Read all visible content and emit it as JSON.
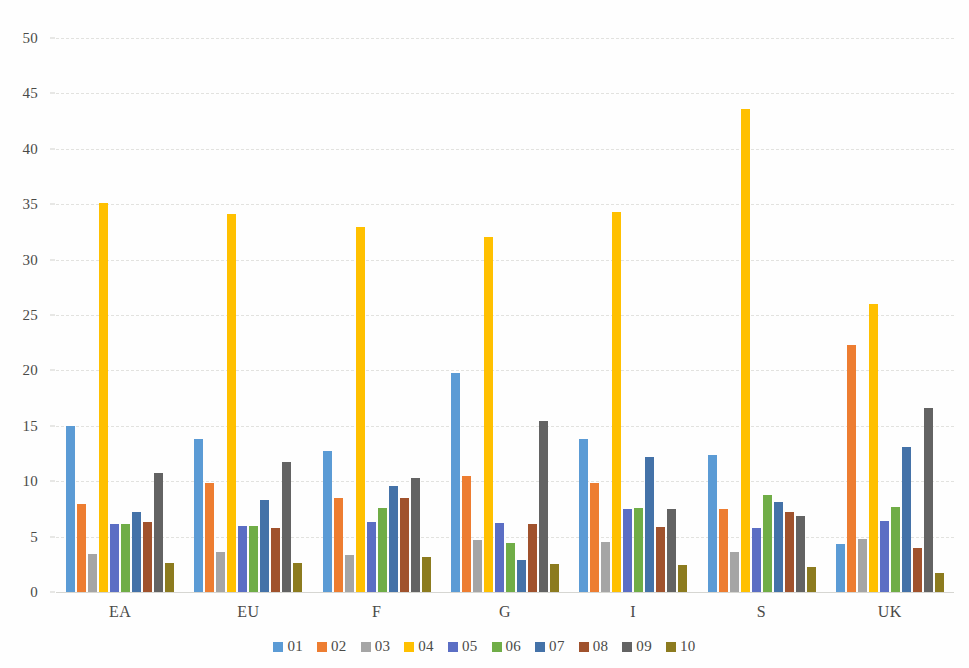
{
  "chart_data": {
    "type": "bar",
    "title": "",
    "subtitle": "",
    "xlabel": "",
    "ylabel": "",
    "ylim": [
      0,
      50
    ],
    "ytick_step": 5,
    "yticks": [
      "50",
      "45",
      "40",
      "35",
      "30",
      "25",
      "20",
      "15",
      "10",
      "5",
      "0"
    ],
    "grid": true,
    "grid_axis": "y",
    "legend_position": "bottom",
    "categories": [
      "EA",
      "EU",
      "F",
      "G",
      "I",
      "S",
      "UK"
    ],
    "series": [
      {
        "name": "01",
        "color": "#5b9bd5",
        "values": [
          15.0,
          13.8,
          12.7,
          19.8,
          13.8,
          12.4,
          4.3
        ]
      },
      {
        "name": "02",
        "color": "#ed7d31",
        "values": [
          7.9,
          9.8,
          8.5,
          10.5,
          9.8,
          7.5,
          22.3
        ]
      },
      {
        "name": "03",
        "color": "#a5a5a5",
        "values": [
          3.4,
          3.6,
          3.3,
          4.7,
          4.5,
          3.6,
          4.8
        ]
      },
      {
        "name": "04",
        "color": "#ffc000",
        "values": [
          35.1,
          34.1,
          32.9,
          32.0,
          34.3,
          43.6,
          26.0
        ]
      },
      {
        "name": "05",
        "color": "#5b6ec4",
        "values": [
          6.1,
          6.0,
          6.3,
          6.2,
          7.5,
          5.8,
          6.4
        ]
      },
      {
        "name": "06",
        "color": "#70ad47",
        "values": [
          6.1,
          6.0,
          7.6,
          4.4,
          7.6,
          8.8,
          7.7
        ]
      },
      {
        "name": "07",
        "color": "#4472a8",
        "values": [
          7.2,
          8.3,
          9.6,
          2.9,
          12.2,
          8.1,
          13.1
        ]
      },
      {
        "name": "08",
        "color": "#a0522d",
        "values": [
          6.3,
          5.8,
          8.5,
          6.1,
          5.9,
          7.2,
          4.0
        ]
      },
      {
        "name": "09",
        "color": "#636363",
        "values": [
          10.7,
          11.7,
          10.3,
          15.4,
          7.5,
          6.9,
          16.6
        ]
      },
      {
        "name": "10",
        "color": "#8c7b1f",
        "values": [
          2.6,
          2.6,
          3.2,
          2.5,
          2.4,
          2.3,
          1.7
        ]
      }
    ]
  },
  "legend": {
    "items": [
      {
        "label": "01"
      },
      {
        "label": "02"
      },
      {
        "label": "03"
      },
      {
        "label": "04"
      },
      {
        "label": "05"
      },
      {
        "label": "06"
      },
      {
        "label": "07"
      },
      {
        "label": "08"
      },
      {
        "label": "09"
      },
      {
        "label": "10"
      }
    ]
  },
  "colors": {
    "background": "#fefefe",
    "gridline": "#e2e2df",
    "axis_text": "#4a4a48"
  }
}
